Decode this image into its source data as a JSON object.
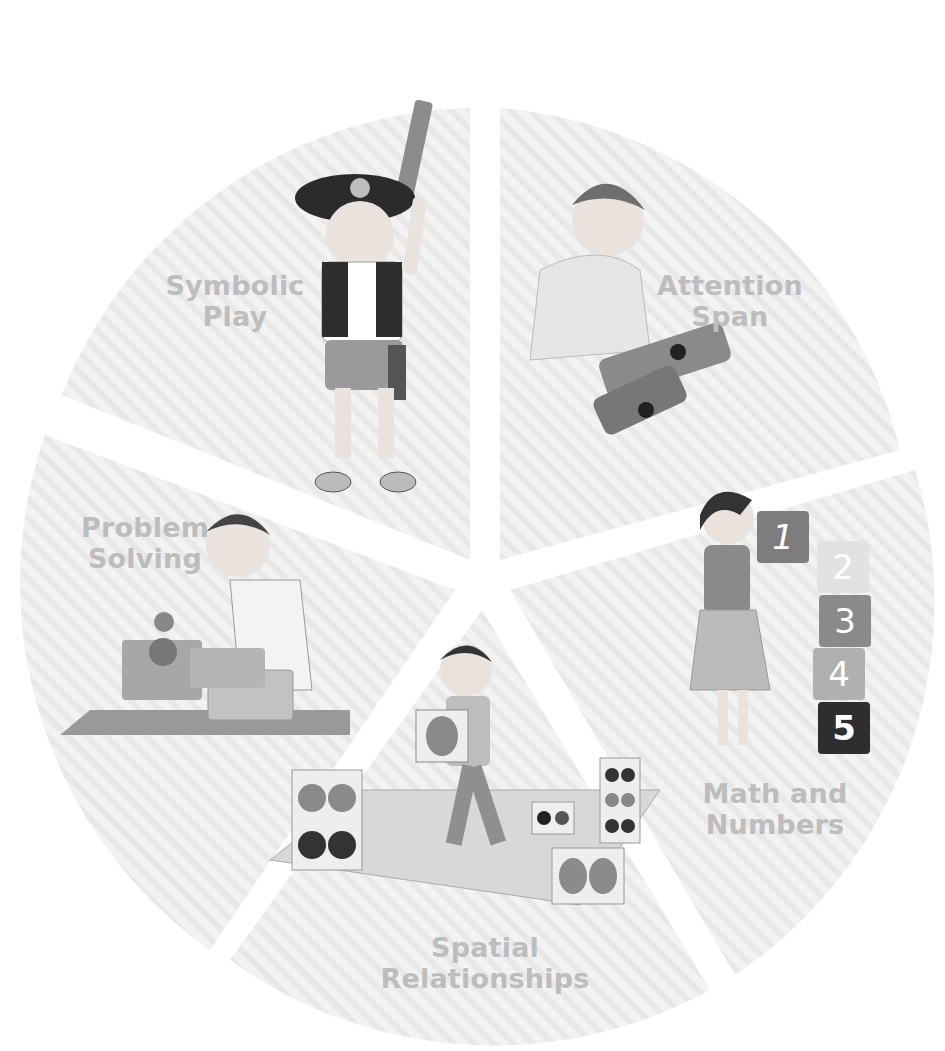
{
  "diagram": {
    "type": "segmented-wheel",
    "segment_count": 5,
    "colors": {
      "segment_fill": "#f0f0f0",
      "stripe": "#e6e6e6",
      "label": "#bdbdbd",
      "block_1": "#7d7d7d",
      "block_2": "#e2e2e2",
      "block_3": "#8a8a8a",
      "block_4": "#b0b0b0",
      "block_5": "#2e2e2e"
    },
    "segments": [
      {
        "id": "symbolic-play",
        "label_line1": "Symbolic",
        "label_line2": "Play",
        "illustration": "child dressed as pirate holding toy sword"
      },
      {
        "id": "attention-span",
        "label_line1": "Attention",
        "label_line2": "Span",
        "illustration": "child kneeling doing a jigsaw puzzle"
      },
      {
        "id": "math-and-numbers",
        "label_line1": "Math and",
        "label_line2": "Numbers",
        "illustration": "girl stacking numbered blocks",
        "blocks": [
          "1",
          "2",
          "3",
          "4",
          "5"
        ]
      },
      {
        "id": "spatial-relationships",
        "label_line1": "Spatial",
        "label_line2": "Relationships",
        "illustration": "child carrying dotted cube across a tiled mat"
      },
      {
        "id": "problem-solving",
        "label_line1": "Problem",
        "label_line2": "Solving",
        "illustration": "child using a shape sorter box"
      }
    ]
  }
}
